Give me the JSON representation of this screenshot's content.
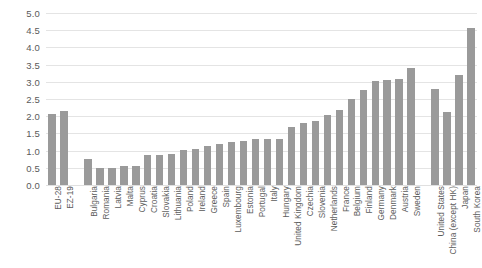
{
  "chart_data": {
    "type": "bar",
    "title": "",
    "subtitle": "",
    "xlabel": "",
    "ylabel": "",
    "ylim": [
      0,
      5.0
    ],
    "ytick_step": 0.5,
    "grid": true,
    "legend": "none",
    "bar_color": "#9a9a9a",
    "grid_color": "#e4e4e4",
    "axis_text_color": "#5a5a5a",
    "ytick_labels": [
      "5.0",
      "4.5",
      "4.0",
      "3.5",
      "3.0",
      "2.5",
      "2.0",
      "1.5",
      "1.0",
      "0.5",
      "0.0"
    ],
    "ytick_values": [
      5.0,
      4.5,
      4.0,
      3.5,
      3.0,
      2.5,
      2.0,
      1.5,
      1.0,
      0.5,
      0.0
    ],
    "groups": [
      {
        "name": "aggregates",
        "categories": [
          "EU-28",
          "EZ-19"
        ],
        "values": [
          2.06,
          2.15
        ]
      },
      {
        "name": "member-states",
        "categories": [
          "Bulgaria",
          "Romania",
          "Latvia",
          "Malta",
          "Cyprus",
          "Croatia",
          "Slovakia",
          "Lithuania",
          "Poland",
          "Ireland",
          "Greece",
          "Spain",
          "Luxembourg",
          "Estonia",
          "Portugal",
          "Italy",
          "Hungary",
          "United Kingdom",
          "Czechia",
          "Slovenia",
          "Netherlands",
          "France",
          "Belgium",
          "Finland",
          "Germany",
          "Denmark",
          "Austria",
          "Sweden"
        ],
        "values": [
          0.75,
          0.5,
          0.5,
          0.55,
          0.56,
          0.86,
          0.88,
          0.9,
          1.03,
          1.05,
          1.13,
          1.19,
          1.26,
          1.28,
          1.33,
          1.35,
          1.35,
          1.69,
          1.79,
          1.86,
          2.03,
          2.19,
          2.49,
          2.76,
          3.02,
          3.05,
          3.09,
          3.4
        ]
      },
      {
        "name": "non-eu",
        "categories": [
          "United States",
          "China (except HK)",
          "Japan",
          "South Korea"
        ],
        "values": [
          2.79,
          2.11,
          3.2,
          4.55
        ]
      }
    ]
  }
}
